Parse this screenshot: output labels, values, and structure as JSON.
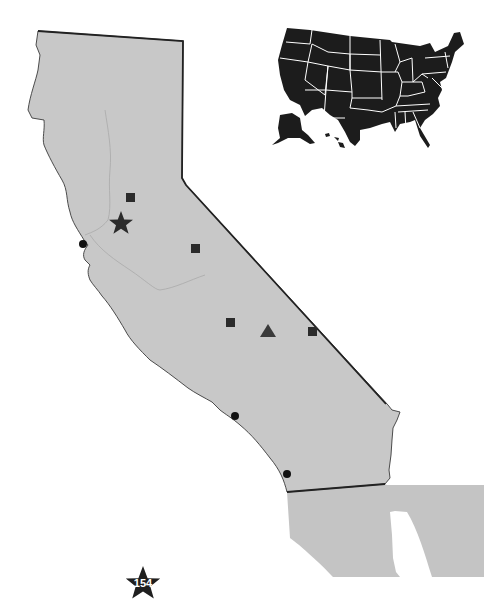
{
  "map": {
    "title": "",
    "region": "California",
    "inset": "United States",
    "colors": {
      "land": "#c8c8c8",
      "mexico_land": "#c4c4c4",
      "border": "#2a2a2a",
      "river": "#a8a8a8",
      "marker": "#2b2b2b",
      "inset_fill": "#1c1c1c",
      "inset_lines": "#ffffff",
      "background": "#ffffff"
    },
    "markers": [
      {
        "type": "square",
        "label": "site-1"
      },
      {
        "type": "star",
        "label": "capital-star"
      },
      {
        "type": "circle",
        "label": "coastal-city-1"
      },
      {
        "type": "square",
        "label": "site-2"
      },
      {
        "type": "square",
        "label": "site-3"
      },
      {
        "type": "triangle",
        "label": "site-4"
      },
      {
        "type": "square",
        "label": "site-5"
      },
      {
        "type": "circle",
        "label": "coastal-city-2"
      },
      {
        "type": "circle",
        "label": "coastal-city-3"
      }
    ],
    "badge": {
      "icon": "star-icon",
      "text": "154"
    }
  }
}
